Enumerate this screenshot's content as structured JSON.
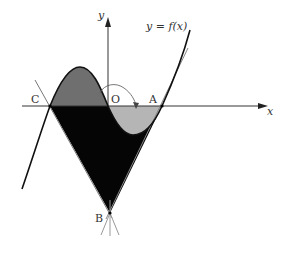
{
  "diagram": {
    "curve_label": "y = f(x)",
    "axis_x_label": "x",
    "axis_y_label": "y",
    "points": {
      "C": "C",
      "O": "O",
      "A": "A",
      "B": "B"
    },
    "colors": {
      "region_upper_left": "#6f6f6f",
      "region_lower_right": "#b5b5b5",
      "region_triangle": "#050505",
      "curve": "#111111",
      "axes": "#333333",
      "tangent_lines": "#888888"
    }
  }
}
